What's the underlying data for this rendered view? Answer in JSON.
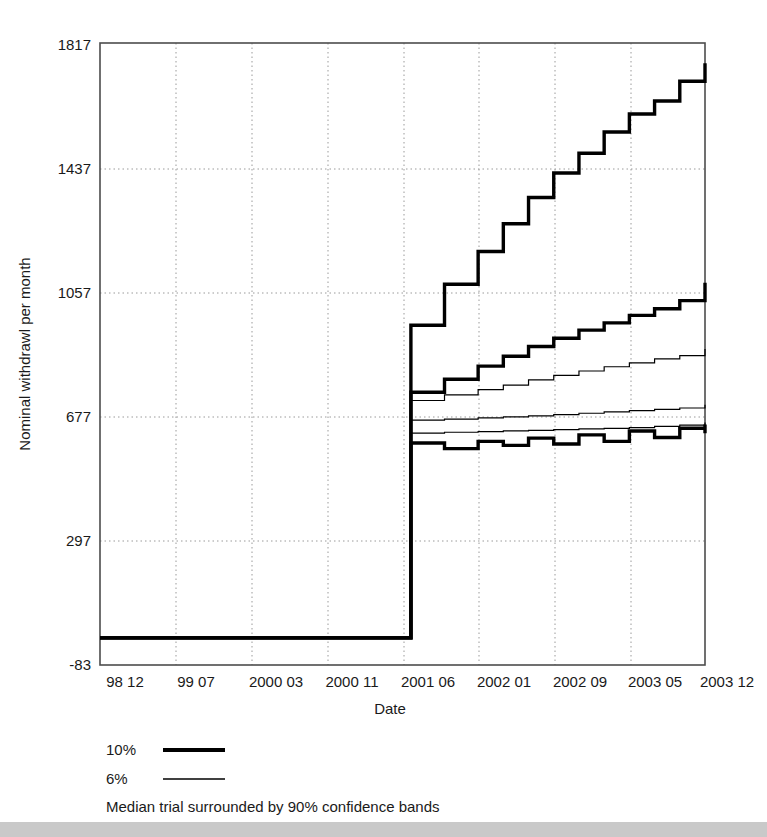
{
  "chart_data": {
    "type": "line",
    "title": "",
    "xlabel": "Date",
    "ylabel": "Nominal withdrawl per month",
    "grid": true,
    "legend_position": "below-left",
    "caption": "Median trial surrounded by 90% confidence bands",
    "ylim": [
      -83,
      1817
    ],
    "yticks": [
      -83,
      297,
      677,
      1057,
      1437,
      1817
    ],
    "ytick_labels": [
      "-83",
      "297",
      "677",
      "1057",
      "1437",
      "1817"
    ],
    "xtick_labels": [
      "98 12",
      "99 07",
      "2000 03",
      "2000 11",
      "2001 06",
      "2002 01",
      "2002 09",
      "2003 05",
      "2003 12"
    ],
    "x_index_range": [
      0,
      72
    ],
    "xtick_indices": [
      0,
      7,
      15,
      23,
      30,
      37,
      45,
      53,
      60
    ],
    "legend": [
      {
        "label": "10%",
        "style": "thick"
      },
      {
        "label": "6%",
        "style": "thin"
      }
    ],
    "series": [
      {
        "name": "10% upper confidence band",
        "style": "thick",
        "x": [
          0,
          37,
          37,
          41,
          41,
          45,
          45,
          48,
          48,
          51,
          51,
          54,
          54,
          57,
          57,
          60,
          60,
          63,
          63,
          66,
          66,
          69,
          69,
          72,
          72,
          75,
          75,
          78
        ],
        "values": [
          0,
          0,
          955,
          955,
          1080,
          1080,
          1180,
          1180,
          1265,
          1265,
          1345,
          1345,
          1420,
          1420,
          1480,
          1480,
          1545,
          1545,
          1600,
          1600,
          1640,
          1640,
          1700,
          1700,
          1755,
          1755,
          1700,
          1700
        ]
      },
      {
        "name": "10% median",
        "style": "thick",
        "x": [
          0,
          37,
          37,
          41,
          41,
          45,
          45,
          48,
          48,
          51,
          51,
          54,
          54,
          57,
          57,
          60,
          60,
          63,
          63,
          66,
          66,
          69,
          69,
          72,
          72,
          75,
          75,
          78
        ],
        "values": [
          0,
          0,
          750,
          750,
          790,
          790,
          830,
          830,
          860,
          860,
          890,
          890,
          915,
          915,
          940,
          940,
          962,
          962,
          985,
          985,
          1005,
          1005,
          1030,
          1030,
          1045,
          1045,
          1085,
          1085
        ]
      },
      {
        "name": "10% lower confidence band",
        "style": "thick",
        "x": [
          0,
          37,
          37,
          41,
          41,
          45,
          45,
          48,
          48,
          51,
          51,
          54,
          54,
          57,
          57,
          60,
          60,
          63,
          63,
          66,
          66,
          69,
          69,
          72,
          72,
          75,
          75,
          78
        ],
        "values": [
          0,
          0,
          595,
          595,
          578,
          578,
          600,
          600,
          588,
          588,
          610,
          610,
          592,
          592,
          620,
          620,
          600,
          600,
          632,
          632,
          612,
          612,
          640,
          640,
          625,
          625,
          652,
          652
        ]
      },
      {
        "name": "6% upper confidence band",
        "style": "thin",
        "x": [
          0,
          37,
          37,
          41,
          41,
          45,
          45,
          48,
          48,
          51,
          51,
          54,
          54,
          57,
          57,
          60,
          60,
          63,
          63,
          66,
          66,
          69,
          69,
          72,
          72,
          75,
          75,
          78
        ],
        "values": [
          0,
          0,
          725,
          725,
          742,
          742,
          758,
          758,
          772,
          772,
          788,
          788,
          802,
          802,
          815,
          815,
          828,
          828,
          840,
          840,
          852,
          852,
          862,
          862,
          872,
          872,
          882,
          882
        ]
      },
      {
        "name": "6% median",
        "style": "thin",
        "x": [
          0,
          37,
          37,
          41,
          41,
          45,
          45,
          48,
          48,
          51,
          51,
          54,
          54,
          57,
          57,
          60,
          60,
          63,
          63,
          66,
          66,
          69,
          69,
          72,
          72,
          75,
          75,
          78
        ],
        "values": [
          0,
          0,
          665,
          665,
          668,
          668,
          672,
          672,
          675,
          675,
          678,
          678,
          682,
          682,
          686,
          686,
          690,
          690,
          694,
          694,
          698,
          698,
          702,
          702,
          706,
          706,
          712,
          712
        ]
      },
      {
        "name": "6% lower confidence band",
        "style": "thin",
        "x": [
          0,
          37,
          37,
          41,
          41,
          45,
          45,
          48,
          48,
          51,
          51,
          54,
          54,
          57,
          57,
          60,
          60,
          63,
          63,
          66,
          66,
          69,
          69,
          72,
          72,
          75,
          75,
          78
        ],
        "values": [
          0,
          0,
          625,
          625,
          628,
          628,
          630,
          630,
          632,
          632,
          634,
          634,
          636,
          636,
          638,
          638,
          640,
          640,
          642,
          642,
          646,
          646,
          650,
          650,
          654,
          654,
          658,
          658
        ]
      }
    ]
  },
  "axis": {
    "y_title": "Nominal withdrawl per month",
    "x_title": "Date",
    "y_ticks": [
      "1817",
      "1437",
      "1057",
      "677",
      "297",
      "-83"
    ],
    "x_ticks": [
      "98 12",
      "99 07",
      "2000 03",
      "2000 11",
      "2001 06",
      "2002 01",
      "2002 09",
      "2003 05",
      "2003 12"
    ]
  },
  "legend": {
    "entry_10_label": "10%",
    "entry_6_label": "6%",
    "caption": "Median trial surrounded by 90% confidence bands"
  },
  "colors": {
    "line": "#000000",
    "grid": "#9a9a9a",
    "frame": "#4d4d4d",
    "text": "#1a1a1a",
    "bottom_strip": "#c9c9c9"
  }
}
